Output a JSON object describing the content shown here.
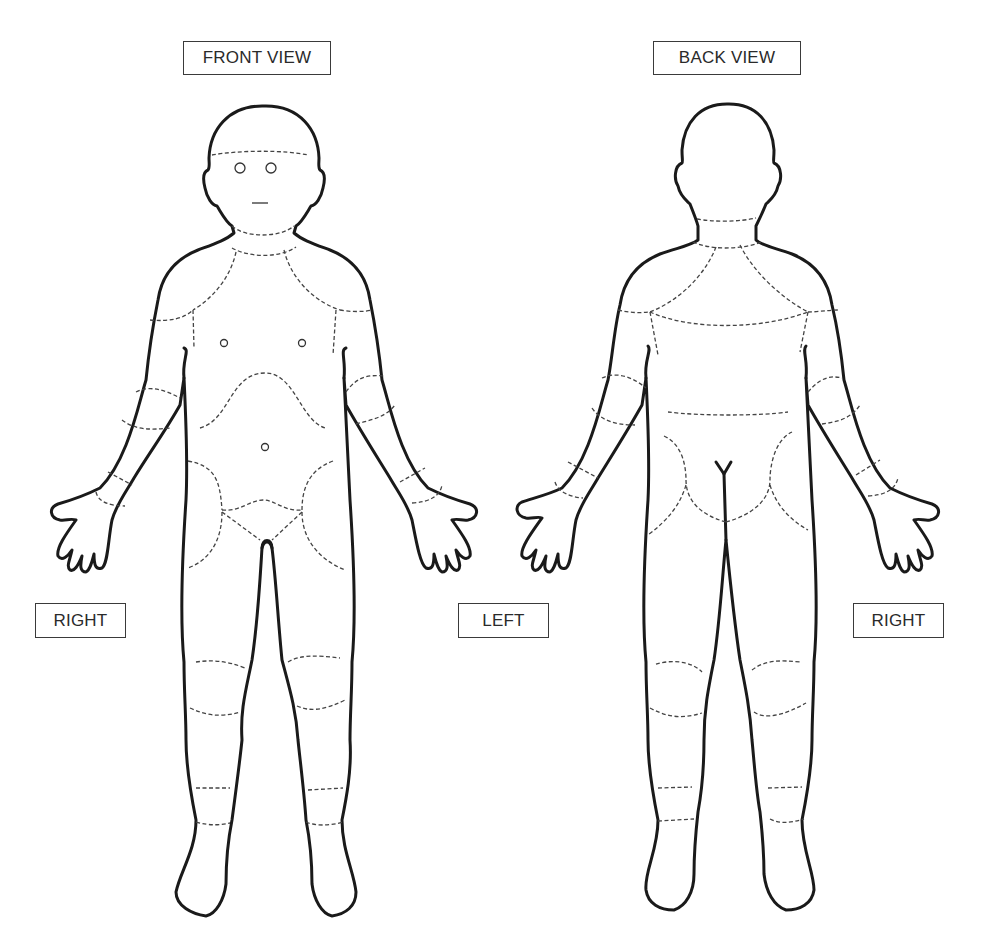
{
  "labels": {
    "front_view": "FRONT VIEW",
    "back_view": "BACK VIEW",
    "front_right": "RIGHT",
    "middle_left": "LEFT",
    "back_right": "RIGHT"
  },
  "figures": [
    {
      "name": "front-view-body",
      "view": "front",
      "features": [
        "eyes",
        "mouth",
        "nipples",
        "navel",
        "genital region"
      ]
    },
    {
      "name": "back-view-body",
      "view": "back",
      "features": [
        "buttocks",
        "gluteal cleft"
      ]
    }
  ],
  "style": {
    "outline_color": "#1a1a1a",
    "region_line_color": "#444444",
    "background": "#ffffff"
  }
}
